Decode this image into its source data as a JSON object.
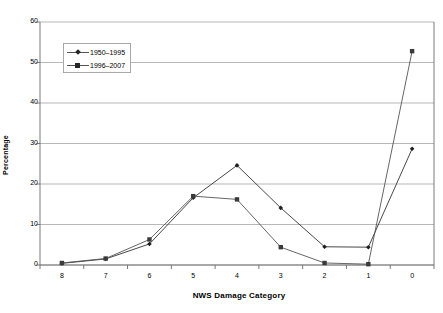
{
  "chart_data": {
    "type": "line",
    "title": "",
    "xlabel": "NWS Damage Category",
    "ylabel": "Percentage",
    "categories": [
      "8",
      "7",
      "6",
      "5",
      "4",
      "3",
      "2",
      "1",
      "0"
    ],
    "xtick_labels": [
      "8",
      "7",
      "6",
      "5",
      "4",
      "3",
      "2",
      "1",
      "0"
    ],
    "ytick_labels": [
      "0",
      "10",
      "20",
      "30",
      "40",
      "50",
      "60"
    ],
    "ylim": [
      0,
      60
    ],
    "yticks": [
      0,
      10,
      20,
      30,
      40,
      50,
      60
    ],
    "grid": "horizontal",
    "legend_position": "upper-left-inside",
    "series": [
      {
        "name": "1950–1995",
        "marker": "diamond",
        "color": "#333333",
        "values": [
          0.4,
          1.5,
          5.2,
          16.6,
          24.6,
          14.1,
          4.5,
          4.4,
          28.7
        ]
      },
      {
        "name": "1996–2007",
        "marker": "square",
        "color": "#555555",
        "values": [
          0.5,
          1.6,
          6.3,
          17.0,
          16.2,
          4.4,
          0.5,
          0.2,
          52.8
        ]
      }
    ]
  },
  "legend": {
    "items": [
      {
        "label": "1950–1995",
        "marker": "diamond"
      },
      {
        "label": "1996–2007",
        "marker": "square"
      }
    ]
  },
  "axes": {
    "x_title": "NWS Damage Category",
    "y_title": "Percentage"
  }
}
